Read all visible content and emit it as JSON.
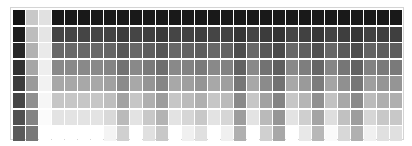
{
  "chart_data": {
    "type": "heatmap",
    "title": "",
    "xlabel": "",
    "ylabel": "",
    "rows": 8,
    "cols": 30,
    "grid": false,
    "legend": "none",
    "colormap": "grayscale (0 = black, 255 = white)",
    "column_profiles": [
      {
        "col": 0,
        "top": 20,
        "bottom": 90
      },
      {
        "col": 1,
        "top": 200,
        "bottom": 120
      },
      {
        "col": 2,
        "top": 225,
        "bottom": 255
      },
      {
        "col": 3,
        "top": 25,
        "bottom": 255
      },
      {
        "col": 4,
        "top": 25,
        "bottom": 255
      },
      {
        "col": 5,
        "top": 25,
        "bottom": 255
      },
      {
        "col": 6,
        "top": 25,
        "bottom": 255
      },
      {
        "col": 7,
        "top": 25,
        "bottom": 244
      },
      {
        "col": 8,
        "top": 25,
        "bottom": 208
      },
      {
        "col": 9,
        "top": 25,
        "bottom": 255
      },
      {
        "col": 10,
        "top": 25,
        "bottom": 224
      },
      {
        "col": 11,
        "top": 25,
        "bottom": 200
      },
      {
        "col": 12,
        "top": 25,
        "bottom": 255
      },
      {
        "col": 13,
        "top": 25,
        "bottom": 240
      },
      {
        "col": 14,
        "top": 25,
        "bottom": 224
      },
      {
        "col": 15,
        "top": 25,
        "bottom": 255
      },
      {
        "col": 16,
        "top": 25,
        "bottom": 240
      },
      {
        "col": 17,
        "top": 25,
        "bottom": 176
      },
      {
        "col": 18,
        "top": 25,
        "bottom": 255
      },
      {
        "col": 19,
        "top": 25,
        "bottom": 208
      },
      {
        "col": 20,
        "top": 25,
        "bottom": 168
      },
      {
        "col": 21,
        "top": 25,
        "bottom": 255
      },
      {
        "col": 22,
        "top": 25,
        "bottom": 232
      },
      {
        "col": 23,
        "top": 25,
        "bottom": 184
      },
      {
        "col": 24,
        "top": 25,
        "bottom": 250
      },
      {
        "col": 25,
        "top": 25,
        "bottom": 216
      },
      {
        "col": 26,
        "top": 25,
        "bottom": 176
      },
      {
        "col": 27,
        "top": 25,
        "bottom": 240
      },
      {
        "col": 28,
        "top": 25,
        "bottom": 224
      },
      {
        "col": 29,
        "top": 25,
        "bottom": 224
      }
    ],
    "note": "Each column is a vertical gradient of 8 gray cells interpolated from top to bottom value."
  }
}
